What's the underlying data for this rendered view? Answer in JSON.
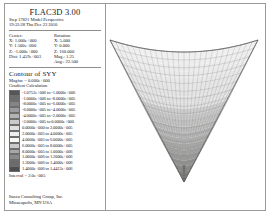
{
  "window": {
    "app_title": "FLAC3D 3.00",
    "step_line": "Step 17821  Model Perspective",
    "timestamp_line": "19:32:28 Thu Dec 23 2010"
  },
  "view": {
    "center_header": "Center:",
    "rotation_header": "Rotation:",
    "center": [
      {
        "axis": "X:",
        "value": "1.000e+000"
      },
      {
        "axis": "Y:",
        "value": "1.500e+000"
      },
      {
        "axis": "Z:",
        "value": "-1.000e+000"
      }
    ],
    "rotation": [
      {
        "axis": "X:",
        "value": "5.000"
      },
      {
        "axis": "Y:",
        "value": "0.000"
      },
      {
        "axis": "Z:",
        "value": "160.000"
      }
    ],
    "dist_label": "Dist:",
    "dist_value": "1.459e+003",
    "mag_label": "Mag.:",
    "mag_value": "1.25",
    "ang_label": "Ang.:",
    "ang_value": "22.500"
  },
  "contour": {
    "title": "Contour of SYY",
    "magfac": "Magfac =  0.000e+000",
    "gradient": "Gradient Calculation",
    "interval": "Interval =  2.0e+005",
    "legend": [
      {
        "color": "#56565a",
        "range": "-1.0752e+006 to -1.0000e+006"
      },
      {
        "color": "#6d6d71",
        "range": "-1.0000e+006 to -8.0000e+005"
      },
      {
        "color": "#848488",
        "range": "-8.0000e+005 to -6.0000e+005"
      },
      {
        "color": "#9b9b9f",
        "range": "-6.0000e+005 to -4.0000e+005"
      },
      {
        "color": "#b3b3b6",
        "range": "-4.0000e+005 to -2.0000e+005"
      },
      {
        "color": "#cacacd",
        "range": "-2.0000e+005 to  0.0000e+000"
      },
      {
        "color": "#e0e0e2",
        "range": " 0.0000e+000 to  2.0000e+005"
      },
      {
        "color": "#efeff0",
        "range": " 2.0000e+005 to  4.0000e+005"
      },
      {
        "color": "#f7f7f8",
        "range": " 4.0000e+005 to  6.0000e+005"
      },
      {
        "color": "#c9c9cc",
        "range": " 6.0000e+005 to  8.0000e+005"
      },
      {
        "color": "#a7a7ab",
        "range": " 8.0000e+005 to  1.0000e+006"
      },
      {
        "color": "#8a8a8e",
        "range": " 1.0000e+006 to  1.2000e+006"
      },
      {
        "color": "#6b6b6f",
        "range": " 1.2000e+006 to  1.4000e+006"
      },
      {
        "color": "#4e4e52",
        "range": " 1.4000e+006 to  1.4413e+006"
      }
    ]
  },
  "footer": {
    "company": "Itasca Consulting Group, Inc.",
    "location": "Minneapolis, MN  USA"
  },
  "mesh": {
    "description": "inverted-pyramid-grid",
    "grid_columns": 26,
    "grid_rows": 18,
    "edge_color": "#6a6a68",
    "fill_light": "#f2f2f2",
    "fill_mid": "#cfcfcf",
    "fill_dark": "#8e8e8e",
    "tip_color": "#6d6d6d"
  }
}
